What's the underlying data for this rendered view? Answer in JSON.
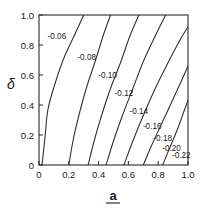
{
  "chart_data": {
    "type": "line",
    "title": "",
    "subtitle": "",
    "xlabel": "a",
    "ylabel": "δ",
    "xlim": [
      0,
      1
    ],
    "ylim": [
      0,
      1
    ],
    "xticks": [
      "0",
      "0.2",
      "0.4",
      "0.6",
      "0.8",
      "1.0"
    ],
    "xtick_values": [
      0,
      0.2,
      0.4,
      0.6,
      0.8,
      1.0
    ],
    "yticks": [
      "0",
      "0.2",
      "0.4",
      "0.6",
      "0.8",
      "1.0"
    ],
    "ytick_values": [
      0,
      0.2,
      0.4,
      0.6,
      0.8,
      1.0
    ],
    "grid": false,
    "legend": false,
    "legend_position": "none",
    "plot_style": "contour",
    "contour_levels": [
      -0.06,
      -0.08,
      -0.1,
      -0.12,
      -0.14,
      -0.16,
      -0.18,
      -0.2,
      -0.22
    ],
    "series": [
      {
        "name": "-0.06",
        "label": "-0.06",
        "label_x": 0.12,
        "label_y": 0.86,
        "points": [
          [
            0.02,
            0.0
          ],
          [
            0.04,
            0.18
          ],
          [
            0.06,
            0.37
          ],
          [
            0.11,
            0.55
          ],
          [
            0.17,
            0.72
          ],
          [
            0.24,
            0.87
          ],
          [
            0.3,
            1.0
          ]
        ]
      },
      {
        "name": "-0.08",
        "label": "-0.08",
        "label_x": 0.32,
        "label_y": 0.72,
        "points": [
          [
            0.2,
            0.0
          ],
          [
            0.23,
            0.17
          ],
          [
            0.27,
            0.34
          ],
          [
            0.32,
            0.52
          ],
          [
            0.38,
            0.7
          ],
          [
            0.43,
            0.86
          ],
          [
            0.48,
            1.0
          ]
        ]
      },
      {
        "name": "-0.10",
        "label": "-0.10",
        "label_x": 0.46,
        "label_y": 0.6,
        "points": [
          [
            0.33,
            0.0
          ],
          [
            0.37,
            0.16
          ],
          [
            0.42,
            0.33
          ],
          [
            0.48,
            0.51
          ],
          [
            0.55,
            0.69
          ],
          [
            0.61,
            0.86
          ],
          [
            0.67,
            1.0
          ]
        ]
      },
      {
        "name": "-0.12",
        "label": "-0.12",
        "label_x": 0.57,
        "label_y": 0.48,
        "points": [
          [
            0.45,
            0.0
          ],
          [
            0.5,
            0.16
          ],
          [
            0.56,
            0.33
          ],
          [
            0.63,
            0.51
          ],
          [
            0.7,
            0.69
          ],
          [
            0.78,
            0.86
          ],
          [
            0.85,
            1.0
          ]
        ]
      },
      {
        "name": "-0.14",
        "label": "-0.14",
        "label_x": 0.67,
        "label_y": 0.36,
        "points": [
          [
            0.57,
            0.0
          ],
          [
            0.63,
            0.16
          ],
          [
            0.7,
            0.33
          ],
          [
            0.78,
            0.51
          ],
          [
            0.87,
            0.69
          ],
          [
            0.95,
            0.84
          ],
          [
            1.0,
            0.92
          ]
        ]
      },
      {
        "name": "-0.16",
        "label": "-0.16",
        "label_x": 0.76,
        "label_y": 0.26,
        "points": [
          [
            0.7,
            0.0
          ],
          [
            0.76,
            0.14
          ],
          [
            0.83,
            0.29
          ],
          [
            0.9,
            0.44
          ],
          [
            0.96,
            0.57
          ],
          [
            1.0,
            0.66
          ]
        ]
      },
      {
        "name": "-0.18",
        "label": "-0.18",
        "label_x": 0.83,
        "label_y": 0.18,
        "points": [
          [
            0.83,
            0.0
          ],
          [
            0.88,
            0.12
          ],
          [
            0.93,
            0.24
          ],
          [
            0.97,
            0.35
          ],
          [
            1.0,
            0.43
          ]
        ]
      },
      {
        "name": "-0.20",
        "label": "-0.20",
        "label_x": 0.89,
        "label_y": 0.115
      },
      {
        "name": "-0.22",
        "label": "-0.22",
        "label_x": 0.955,
        "label_y": 0.065
      }
    ],
    "annotations": []
  },
  "axes": {
    "x_title": "a",
    "y_title": "δ"
  },
  "colors": {
    "background": "#ffffff",
    "line": "#2b2b2b",
    "axis": "#2b2b2b",
    "text": "#1a1a1a"
  }
}
